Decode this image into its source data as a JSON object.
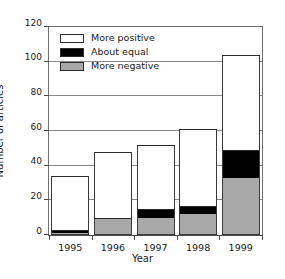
{
  "chart_data": {
    "type": "bar",
    "subtype": "stacked-bar",
    "title": "",
    "xlabel": "Year",
    "ylabel": "Number of articles",
    "categories": [
      "1995",
      "1996",
      "1997",
      "1998",
      "1999"
    ],
    "series": [
      {
        "name": "More negative",
        "color": "#a8a8a8",
        "values": [
          1,
          9,
          10,
          12,
          33
        ]
      },
      {
        "name": "About equal",
        "color": "#000000",
        "values": [
          2,
          1,
          5,
          5,
          16
        ]
      },
      {
        "name": "More positive",
        "color": "#ffffff",
        "values": [
          31,
          38,
          37,
          44,
          55
        ]
      }
    ],
    "totals": [
      34,
      48,
      52,
      61,
      104
    ],
    "ylim": [
      0,
      120
    ],
    "yticks": [
      0,
      20,
      40,
      60,
      80,
      100,
      120
    ],
    "ytick_labels": [
      "0",
      "20",
      "40",
      "60",
      "80",
      "100",
      "120"
    ],
    "grid": "horizontal",
    "legend_position": "top-left",
    "legend": [
      {
        "label": "More positive",
        "color": "#ffffff"
      },
      {
        "label": "About equal",
        "color": "#000000"
      },
      {
        "label": "More negative",
        "color": "#a8a8a8"
      }
    ],
    "stack_order_bottom_to_top": [
      "More negative",
      "About equal",
      "More positive"
    ]
  }
}
